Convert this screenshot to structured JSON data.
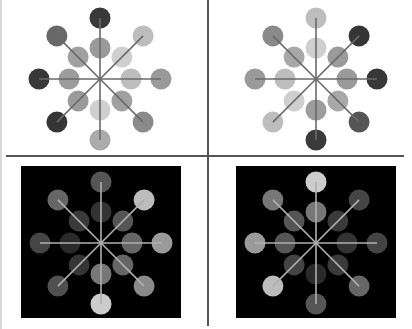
{
  "figure": {
    "layout": "2x2 grid",
    "spoke_count": 8,
    "panels": [
      {
        "id": "top-left",
        "background": "#ffffff",
        "line_color": "#6a6a6a",
        "outer": [
          "#3a3a3a",
          "#bdbdbd",
          "#9a9a9a",
          "#8a8a8a",
          "#ababab",
          "#353535",
          "#383838",
          "#686868"
        ],
        "inner": [
          "#9a9a9a",
          "#cfcfcf",
          "#bdbdbd",
          "#a0a0a0",
          "#cfcfcf",
          "#9a9a9a",
          "#9c9c9c",
          "#a0a0a0"
        ]
      },
      {
        "id": "top-right",
        "background": "#ffffff",
        "line_color": "#6a6a6a",
        "outer": [
          "#bdbdbd",
          "#353535",
          "#383838",
          "#555555",
          "#3a3a3a",
          "#bdbdbd",
          "#9a9a9a",
          "#8a8a8a"
        ],
        "inner": [
          "#cfcfcf",
          "#9a9a9a",
          "#9a9a9a",
          "#a8a8a8",
          "#9c9c9c",
          "#cfcfcf",
          "#bdbdbd",
          "#a8a8a8"
        ]
      },
      {
        "id": "bottom-left",
        "background": "#000000",
        "line_color": "#b0b0b0",
        "outer": [
          "#555555",
          "#bcbcbc",
          "#9a9a9a",
          "#8a8a8a",
          "#cccccc",
          "#505050",
          "#454545",
          "#666666"
        ],
        "inner": [
          "#333333",
          "#555555",
          "#666666",
          "#666666",
          "#777777",
          "#353535",
          "#2a2a2a",
          "#3a3a3a"
        ]
      },
      {
        "id": "bottom-right",
        "background": "#000000",
        "line_color": "#b0b0b0",
        "outer": [
          "#cccccc",
          "#454545",
          "#444444",
          "#666666",
          "#555555",
          "#bcbcbc",
          "#9a9a9a",
          "#777777"
        ],
        "inner": [
          "#777777",
          "#3a3a3a",
          "#333333",
          "#3a3a3a",
          "#2a2a2a",
          "#444444",
          "#555555",
          "#555555"
        ]
      }
    ]
  },
  "caption": ""
}
